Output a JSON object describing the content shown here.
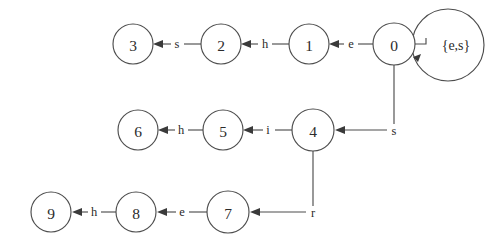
{
  "diagram": {
    "type": "state-transition-diagram",
    "title": "",
    "background_color": "#ffffff",
    "stroke_color": "#4d4d4d",
    "text_color": "#2b2b2b",
    "node_radius": 20,
    "nodes": [
      {
        "id": "3",
        "label": "3",
        "cx": 133,
        "cy": 44,
        "r": 20
      },
      {
        "id": "2",
        "label": "2",
        "cx": 221,
        "cy": 44,
        "r": 20
      },
      {
        "id": "1",
        "label": "1",
        "cx": 309,
        "cy": 44,
        "r": 20
      },
      {
        "id": "0",
        "label": "0",
        "cx": 394,
        "cy": 44,
        "r": 21
      },
      {
        "id": "6",
        "label": "6",
        "cx": 138,
        "cy": 130,
        "r": 20
      },
      {
        "id": "5",
        "label": "5",
        "cx": 223,
        "cy": 130,
        "r": 20
      },
      {
        "id": "4",
        "label": "4",
        "cx": 313,
        "cy": 130,
        "r": 21
      },
      {
        "id": "9",
        "label": "9",
        "cx": 51,
        "cy": 212,
        "r": 20
      },
      {
        "id": "8",
        "label": "8",
        "cx": 136,
        "cy": 212,
        "r": 20
      },
      {
        "id": "7",
        "label": "7",
        "cx": 228,
        "cy": 212,
        "r": 21
      }
    ],
    "edges": [
      {
        "id": "e-2-3",
        "from": "2",
        "to": "3",
        "label": "s",
        "label_x": 177,
        "label_y": 44,
        "direction": "left"
      },
      {
        "id": "e-1-2",
        "from": "1",
        "to": "2",
        "label": "h",
        "label_x": 265,
        "label_y": 44,
        "direction": "left"
      },
      {
        "id": "e-0-1",
        "from": "0",
        "to": "1",
        "label": "e",
        "label_x": 351,
        "label_y": 44,
        "direction": "left"
      },
      {
        "id": "e-5-6",
        "from": "5",
        "to": "6",
        "label": "h",
        "label_x": 181,
        "label_y": 130,
        "direction": "left"
      },
      {
        "id": "e-4-5",
        "from": "4",
        "to": "5",
        "label": "i",
        "label_x": 268,
        "label_y": 130,
        "direction": "left"
      },
      {
        "id": "e-0-4",
        "from": "0",
        "to": "4",
        "label": "s",
        "label_x": 394,
        "label_y": 130,
        "direction": "left-elbow"
      },
      {
        "id": "e-8-9",
        "from": "8",
        "to": "9",
        "label": "h",
        "label_x": 94,
        "label_y": 212,
        "direction": "left"
      },
      {
        "id": "e-7-8",
        "from": "7",
        "to": "8",
        "label": "e",
        "label_x": 182,
        "label_y": 212,
        "direction": "left"
      },
      {
        "id": "e-4-7",
        "from": "4",
        "to": "7",
        "label": "r",
        "label_x": 313,
        "label_y": 212,
        "direction": "left-elbow"
      }
    ],
    "self_loops": [
      {
        "id": "loop-0",
        "node": "0",
        "label": "{e,s}",
        "cx": 448,
        "cy": 45,
        "r": 36,
        "label_x": 456,
        "label_y": 45
      }
    ]
  }
}
